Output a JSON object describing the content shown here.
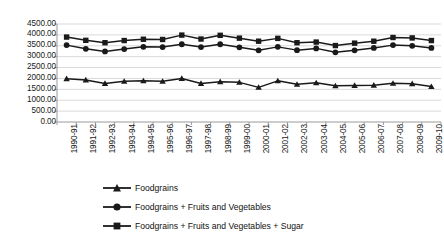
{
  "chart_data": {
    "type": "line",
    "title": "",
    "xlabel": "",
    "ylabel": "",
    "ylim": [
      0,
      4500
    ],
    "ytick_step": 500,
    "grid": true,
    "legend_position": "bottom",
    "categories": [
      "1990-91",
      "1991-92",
      "1992-93",
      "1993-94",
      "1994-95",
      "1995-96",
      "1996-97",
      "1997-98",
      "1998-99",
      "1999-00",
      "2000-01",
      "2001-02",
      "2002-03",
      "2003-04",
      "2004-05",
      "2005-06",
      "2006-07",
      "2007-08",
      "2008-09",
      "2009-10"
    ],
    "ytick_labels": [
      "0.00",
      "500.00",
      "1000.00",
      "1500.00",
      "2000.00",
      "2500.00",
      "3000.00",
      "3500.00",
      "4000.00",
      "4500.00"
    ],
    "series": [
      {
        "name": "Foodgrains",
        "marker": "triangle",
        "color": "#1a1a1a",
        "values": [
          1990,
          1930,
          1770,
          1870,
          1890,
          1870,
          2000,
          1770,
          1850,
          1820,
          1590,
          1890,
          1730,
          1800,
          1660,
          1680,
          1690,
          1780,
          1760,
          1630
        ]
      },
      {
        "name": "Foodgrains + Fruits and Vegetables",
        "marker": "circle",
        "color": "#1a1a1a",
        "values": [
          3530,
          3360,
          3240,
          3350,
          3450,
          3440,
          3570,
          3440,
          3570,
          3430,
          3290,
          3450,
          3300,
          3380,
          3200,
          3290,
          3400,
          3530,
          3500,
          3400
        ]
      },
      {
        "name": "Foodgrains + Fruits and Vegetables + Sugar",
        "marker": "square",
        "color": "#1a1a1a",
        "values": [
          3900,
          3750,
          3640,
          3740,
          3800,
          3790,
          3990,
          3810,
          3980,
          3850,
          3710,
          3840,
          3640,
          3670,
          3510,
          3620,
          3710,
          3880,
          3860,
          3740
        ]
      }
    ]
  },
  "axis": {
    "gridline_color": "#d9d9d9",
    "axis_color": "#9a9a9a",
    "tick_color": "#9a9a9a"
  }
}
